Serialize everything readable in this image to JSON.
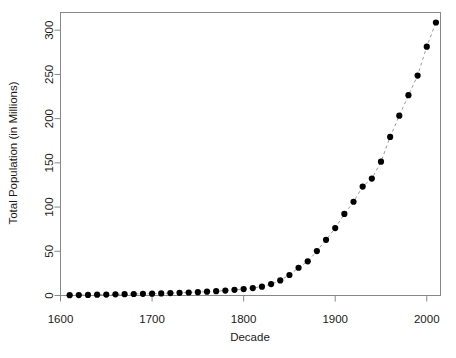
{
  "chart_data": {
    "type": "scatter",
    "title": "",
    "xlabel": "Decade",
    "ylabel": "Total Population (in Millions)",
    "xlim": [
      1600,
      2015
    ],
    "ylim": [
      0,
      320
    ],
    "xticks": [
      1600,
      1700,
      1800,
      1900,
      2000
    ],
    "xticklabels": [
      "1600",
      "1700",
      "1800",
      "1900",
      "2000"
    ],
    "yticks": [
      0,
      50,
      100,
      150,
      200,
      250,
      300
    ],
    "yticklabels": [
      "0",
      "50",
      "100",
      "150",
      "200",
      "250",
      "300"
    ],
    "grid": false,
    "legend": false,
    "marker": "filled-circle",
    "marker_color": "#000000",
    "line_style": "dashed",
    "line_color": "#9a9a9a",
    "x": [
      1610,
      1620,
      1630,
      1640,
      1650,
      1660,
      1670,
      1680,
      1690,
      1700,
      1710,
      1720,
      1730,
      1740,
      1750,
      1760,
      1770,
      1780,
      1790,
      1800,
      1810,
      1820,
      1830,
      1840,
      1850,
      1860,
      1870,
      1880,
      1890,
      1900,
      1910,
      1920,
      1930,
      1940,
      1950,
      1960,
      1970,
      1980,
      1990,
      2000,
      2010
    ],
    "values": [
      0.35,
      0.4,
      0.5,
      0.6,
      0.7,
      0.9,
      1.1,
      1.4,
      1.8,
      2.2,
      2.8,
      3.5,
      4.3,
      5.3,
      6.5,
      7.8,
      9.3,
      11,
      3.9,
      5.3,
      7.2,
      9.6,
      12.9,
      17.1,
      23.2,
      31.4,
      38.6,
      50.2,
      63,
      76.2,
      92.2,
      106,
      123.2,
      132.2,
      151.3,
      179.3,
      203.3,
      226.5,
      248.7,
      281.4,
      308.7
    ],
    "series": [
      {
        "name": "Total Population",
        "points": [
          [
            1610,
            0.35
          ],
          [
            1620,
            0.5
          ],
          [
            1630,
            0.7
          ],
          [
            1640,
            0.9
          ],
          [
            1650,
            1.1
          ],
          [
            1660,
            1.3
          ],
          [
            1670,
            1.5
          ],
          [
            1680,
            1.7
          ],
          [
            1690,
            1.9
          ],
          [
            1700,
            2.1
          ],
          [
            1710,
            2.4
          ],
          [
            1720,
            2.7
          ],
          [
            1730,
            3.0
          ],
          [
            1740,
            3.4
          ],
          [
            1750,
            3.8
          ],
          [
            1760,
            4.3
          ],
          [
            1770,
            4.9
          ],
          [
            1780,
            5.6
          ],
          [
            1790,
            6.4
          ],
          [
            1800,
            7.3
          ],
          [
            1810,
            8.4
          ],
          [
            1820,
            10.0
          ],
          [
            1830,
            12.9
          ],
          [
            1840,
            17.1
          ],
          [
            1850,
            23.2
          ],
          [
            1860,
            31.4
          ],
          [
            1870,
            38.6
          ],
          [
            1880,
            50.2
          ],
          [
            1890,
            63.0
          ],
          [
            1900,
            76.2
          ],
          [
            1910,
            92.2
          ],
          [
            1920,
            106.0
          ],
          [
            1930,
            123.2
          ],
          [
            1940,
            132.2
          ],
          [
            1950,
            151.3
          ],
          [
            1960,
            179.3
          ],
          [
            1970,
            203.3
          ],
          [
            1980,
            226.5
          ],
          [
            1990,
            248.7
          ],
          [
            2000,
            281.4
          ],
          [
            2010,
            308.7
          ]
        ]
      }
    ]
  },
  "axes": {
    "x_title": "Decade",
    "y_title": "Total Population (in Millions)"
  }
}
